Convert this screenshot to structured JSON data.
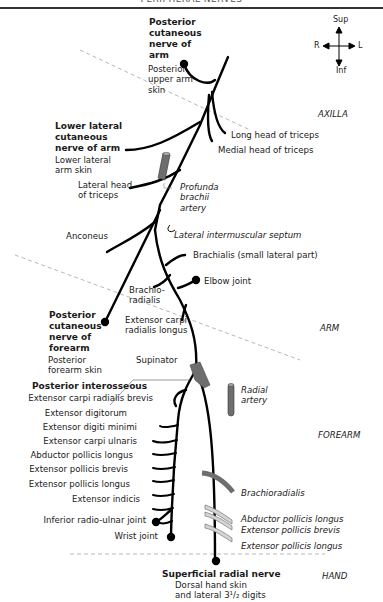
{
  "header": {
    "title": "PERIPHERAL NERVES"
  },
  "orientation": {
    "sup": "Sup",
    "inf": "Inf",
    "right": "R",
    "left": "L"
  },
  "regions": {
    "axilla": "AXILLA",
    "arm": "ARM",
    "forearm": "FOREARM",
    "hand": "HAND"
  },
  "nerves": {
    "posterior_cutaneous_arm": {
      "name_lines": [
        "Posterior",
        "cutaneous",
        "nerve of",
        "arm"
      ],
      "target_lines": [
        "Posterior",
        "upper arm",
        "skin"
      ]
    },
    "lower_lateral_cutaneous_arm": {
      "name_lines": [
        "Lower lateral",
        "cutaneous",
        "nerve of arm"
      ],
      "target_lines": [
        "Lower lateral",
        "arm skin"
      ]
    },
    "posterior_cutaneous_forearm": {
      "name_lines": [
        "Posterior",
        "cutaneous",
        "nerve of",
        "forearm"
      ],
      "target_lines": [
        "Posterior",
        "forearm skin"
      ]
    },
    "posterior_interosseous": {
      "name": "Posterior interosseous"
    },
    "superficial_radial": {
      "name": "Superficial radial nerve",
      "target_lines": [
        "Dorsal hand skin",
        "and lateral 3¹/₂ digits"
      ]
    }
  },
  "branches": {
    "long_head_triceps": "Long head of triceps",
    "medial_head_triceps": "Medial head of triceps",
    "lateral_head_triceps": [
      "Lateral head",
      "of triceps"
    ],
    "anconeus": "Anconeus",
    "brachialis": "Brachialis (small lateral part)",
    "elbow_joint": "Elbow joint",
    "brachioradialis": [
      "Brachio-",
      "radialis"
    ],
    "ecrl": [
      "Extensor carpi",
      "radialis longus"
    ],
    "supinator": "Supinator"
  },
  "posterior_interosseous_branches": [
    "Extensor carpi radialis brevis",
    "Extensor digitorum",
    "Extensor digiti minimi",
    "Extensor carpi ulnaris",
    "Abductor pollicis longus",
    "Extensor pollicis brevis",
    "Extensor pollicis longus",
    "Extensor indicis",
    "Inferior radio-ulnar joint",
    "Wrist joint"
  ],
  "structures": {
    "profunda_brachii": [
      "Profunda",
      "brachii",
      "artery"
    ],
    "lateral_intermuscular_septum": "Lateral intermuscular septum",
    "radial_artery": [
      "Radial",
      "artery"
    ],
    "brachioradialis_muscle": "Brachioradialis",
    "abductor_pollicis_longus": "Abductor pollicis longus",
    "extensor_pollicis_brevis": "Extensor pollicis brevis",
    "extensor_pollicis_longus": "Extensor pollicis longus"
  },
  "colors": {
    "nerve": "#000000",
    "artery": "#6e6e6e",
    "muscle_light": "#d4d4d4",
    "dashed": "#b8b8b8",
    "text": "#1a1a1a"
  }
}
